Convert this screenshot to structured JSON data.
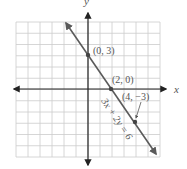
{
  "chart_data": {
    "type": "line",
    "title": "",
    "xlabel": "x",
    "ylabel": "y",
    "xlim": [
      -6,
      6
    ],
    "ylim": [
      -6,
      6
    ],
    "grid": true,
    "equation": "3x + 2y = 6",
    "series": [
      {
        "name": "3x + 2y = 6",
        "x": [
          -2,
          0,
          2,
          4,
          6
        ],
        "y": [
          6,
          3,
          0,
          -3,
          -6
        ]
      }
    ],
    "points": [
      {
        "x": 0,
        "y": 3,
        "label": "(0, 3)"
      },
      {
        "x": 2,
        "y": 0,
        "label": "(2, 0)"
      },
      {
        "x": 4,
        "y": -3,
        "label": "(4, −3)"
      }
    ],
    "colors": {
      "line": "#5a5a5a",
      "axis": "#222222",
      "grid": "#cccccc",
      "text": "#555555"
    }
  },
  "labels": {
    "x_axis": "x",
    "y_axis": "y",
    "p1": "(0, 3)",
    "p2": "(2, 0)",
    "p3": "(4, −3)",
    "equation": "3x + 2y = 6"
  }
}
